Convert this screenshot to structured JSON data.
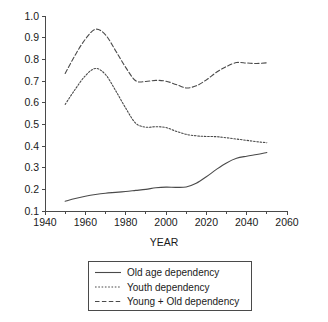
{
  "chart_data": {
    "type": "line",
    "title": "",
    "xlabel": "YEAR",
    "ylabel": "",
    "xlim": [
      1940,
      2060
    ],
    "ylim": [
      0.1,
      1.0
    ],
    "xticks": [
      1940,
      1960,
      1980,
      2000,
      2020,
      2040,
      2060
    ],
    "xtick_labels": [
      "1940",
      "1960",
      "1980",
      "2000",
      "2020",
      "2040",
      "2060"
    ],
    "yticks": [
      0.1,
      0.2,
      0.3,
      0.4,
      0.5,
      0.6,
      0.7,
      0.8,
      0.9,
      1.0
    ],
    "ytick_labels": [
      "0.1",
      "0.2",
      "0.3",
      "0.4",
      "0.5",
      "0.6",
      "0.7",
      "0.8",
      "0.9",
      "1.0"
    ],
    "grid": false,
    "legend_position": "below-axes",
    "x": [
      1950,
      1955,
      1960,
      1965,
      1970,
      1975,
      1980,
      1985,
      1990,
      1995,
      2000,
      2005,
      2010,
      2015,
      2020,
      2025,
      2030,
      2035,
      2040,
      2045,
      2050
    ],
    "series": [
      {
        "name": "Old age dependency",
        "style": "solid",
        "values": [
          0.145,
          0.158,
          0.168,
          0.176,
          0.182,
          0.186,
          0.19,
          0.195,
          0.2,
          0.207,
          0.21,
          0.209,
          0.211,
          0.228,
          0.258,
          0.292,
          0.322,
          0.343,
          0.353,
          0.361,
          0.37
        ]
      },
      {
        "name": "Youth dependency",
        "style": "dotted",
        "values": [
          0.592,
          0.662,
          0.724,
          0.758,
          0.73,
          0.656,
          0.575,
          0.505,
          0.487,
          0.489,
          0.485,
          0.468,
          0.454,
          0.447,
          0.444,
          0.443,
          0.438,
          0.432,
          0.426,
          0.42,
          0.415
        ]
      },
      {
        "name": "Young + Old dependency",
        "style": "dashed",
        "values": [
          0.735,
          0.82,
          0.893,
          0.939,
          0.913,
          0.84,
          0.763,
          0.701,
          0.698,
          0.703,
          0.699,
          0.684,
          0.668,
          0.678,
          0.705,
          0.74,
          0.767,
          0.785,
          0.783,
          0.781,
          0.784
        ]
      }
    ],
    "legend": [
      {
        "label": "Old age dependency",
        "style": "solid"
      },
      {
        "label": "Youth dependency",
        "style": "dotted"
      },
      {
        "label": "Young + Old dependency",
        "style": "dashed"
      }
    ]
  },
  "colors": {
    "ink": "#4a4a4a",
    "text": "#1a1a1a",
    "background": "#ffffff"
  }
}
